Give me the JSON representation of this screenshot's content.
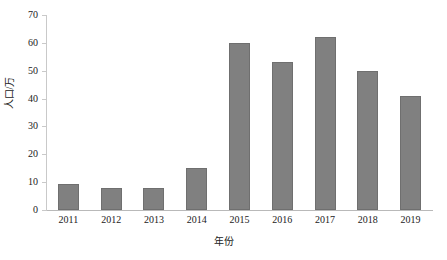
{
  "chart_data": {
    "type": "bar",
    "title": "",
    "xlabel": "年份",
    "ylabel": "人口/万",
    "categories": [
      "2011",
      "2012",
      "2013",
      "2014",
      "2015",
      "2016",
      "2017",
      "2018",
      "2019"
    ],
    "values": [
      9.5,
      8,
      8,
      15,
      60,
      53,
      62,
      50,
      41
    ],
    "ylim": [
      0,
      70
    ],
    "yticks": [
      0,
      10,
      20,
      30,
      40,
      50,
      60,
      70
    ],
    "ytick_labels": [
      "0",
      "10",
      "20",
      "30",
      "40",
      "50",
      "60",
      "70"
    ],
    "grid": false,
    "legend": "none",
    "series": [
      {
        "name": "人口/万",
        "color": "#808080",
        "values": [
          9.5,
          8,
          8,
          15,
          60,
          53,
          62,
          50,
          41
        ]
      }
    ]
  },
  "axes": {
    "y_title": "人口/万",
    "x_title": "年份"
  }
}
